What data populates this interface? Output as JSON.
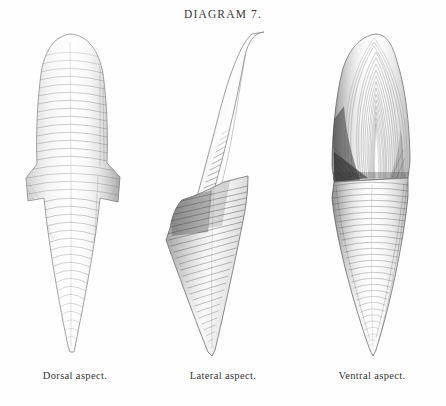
{
  "plate": {
    "title": "DIAGRAM 7.",
    "background_color": "#fefefe",
    "ink_color": "#3a3a3a"
  },
  "figures": [
    {
      "id": "dorsal",
      "caption": "Dorsal aspect.",
      "view_name": "dorsal-aspect",
      "description": "Elongate tapering tooth-like structure, rounded apex above, flaring lateral wings at mid height, drawn to a fine point below; surface covered with fine transverse growth ridges."
    },
    {
      "id": "lateral",
      "caption": "Lateral aspect.",
      "view_name": "lateral-aspect",
      "description": "Hook or scythe shaped profile, slender recurved blade rising to the right, broad shaded base at the left expanding then tapering to a sharp downward point; dense oblique hatching on the concave face."
    },
    {
      "id": "ventral",
      "caption": "Ventral aspect.",
      "view_name": "ventral-aspect",
      "description": "Broad upper lobe marked with concentric nested growth arcs and deep shading on the left flank, constricted below into a long conical spine with fine transverse striations ending in a point."
    }
  ],
  "captions": {
    "dorsal": "Dorsal aspect.",
    "lateral": "Lateral aspect.",
    "ventral": "Ventral aspect."
  }
}
